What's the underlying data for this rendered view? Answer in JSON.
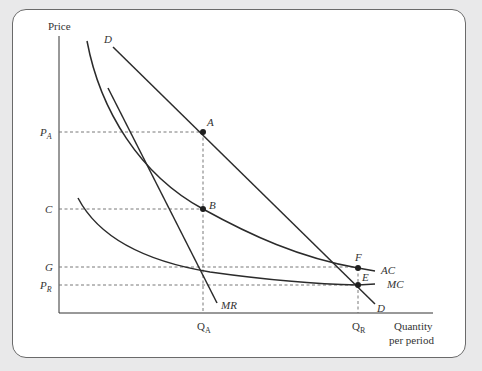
{
  "diagram": {
    "type": "economics-natural-monopoly-regulation",
    "axes": {
      "y_label": "Price",
      "x_label_line1": "Quantity",
      "x_label_line2": "per period"
    },
    "price_levels": [
      {
        "id": "PA",
        "main": "P",
        "sub": "A"
      },
      {
        "id": "C",
        "main": "C",
        "sub": ""
      },
      {
        "id": "G",
        "main": "G",
        "sub": ""
      },
      {
        "id": "PR",
        "main": "P",
        "sub": "R"
      }
    ],
    "quantity_levels": [
      {
        "id": "QA",
        "main": "Q",
        "sub": "A"
      },
      {
        "id": "QR",
        "main": "Q",
        "sub": "R"
      }
    ],
    "curves": {
      "demand_top": "D",
      "demand_bottom": "D",
      "marginal_revenue": "MR",
      "average_cost": "AC",
      "marginal_cost": "MC"
    },
    "points": {
      "A": "A",
      "B": "B",
      "E": "E",
      "F": "F"
    },
    "colors": {
      "line": "#2b2b2b",
      "dash": "#6a6a6a",
      "background": "#ffffff",
      "outer": "#e9e9ea"
    }
  }
}
